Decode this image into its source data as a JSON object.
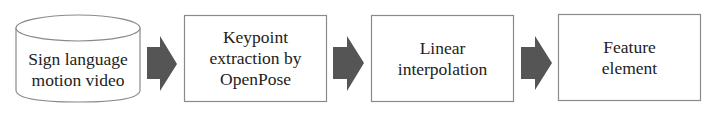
{
  "diagram": {
    "type": "flowchart",
    "direction": "left-to-right",
    "colors": {
      "background": "#ffffff",
      "border": "#8a8a8a",
      "arrow_fill": "#555555",
      "text": "#222222"
    },
    "nodes": [
      {
        "id": "source",
        "shape": "cylinder",
        "lines": [
          "Sign language",
          "motion video"
        ]
      },
      {
        "id": "step1",
        "shape": "rectangle",
        "lines": [
          "Keypoint",
          "extraction by",
          "OpenPose"
        ]
      },
      {
        "id": "step2",
        "shape": "rectangle",
        "lines": [
          "Linear",
          "interpolation"
        ]
      },
      {
        "id": "step3",
        "shape": "rectangle",
        "lines": [
          "Feature",
          "element"
        ]
      }
    ],
    "edges": [
      {
        "from": "source",
        "to": "step1",
        "style": "block-arrow"
      },
      {
        "from": "step1",
        "to": "step2",
        "style": "block-arrow"
      },
      {
        "from": "step2",
        "to": "step3",
        "style": "block-arrow"
      }
    ]
  }
}
